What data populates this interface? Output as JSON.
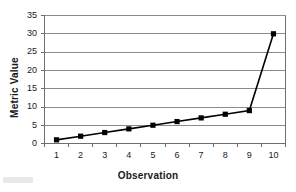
{
  "chart_data": {
    "type": "line",
    "title": "",
    "xlabel": "Observation",
    "ylabel": "Metric Value",
    "categories": [
      1,
      2,
      3,
      4,
      5,
      6,
      7,
      8,
      9,
      10
    ],
    "x_tick_labels": [
      "1",
      "2",
      "3",
      "4",
      "5",
      "6",
      "7",
      "8",
      "9",
      "10"
    ],
    "y_tick_labels": [
      "0",
      "5",
      "10",
      "15",
      "20",
      "25",
      "30",
      "35"
    ],
    "y_ticks": [
      0,
      5,
      10,
      15,
      20,
      25,
      30,
      35
    ],
    "ylim": [
      0,
      35
    ],
    "grid": "horizontal",
    "legend": "none",
    "series": [
      {
        "name": "Metric Value",
        "values": [
          1,
          2,
          3,
          4,
          5,
          6,
          7,
          8,
          9,
          30
        ],
        "line_color": "#000000",
        "marker": "square",
        "marker_color": "#000000"
      }
    ],
    "colors": {
      "gridline": "#8c8c8c",
      "axis": "#6e6e6e",
      "text": "#1a1a1a",
      "background": "#ffffff"
    }
  }
}
